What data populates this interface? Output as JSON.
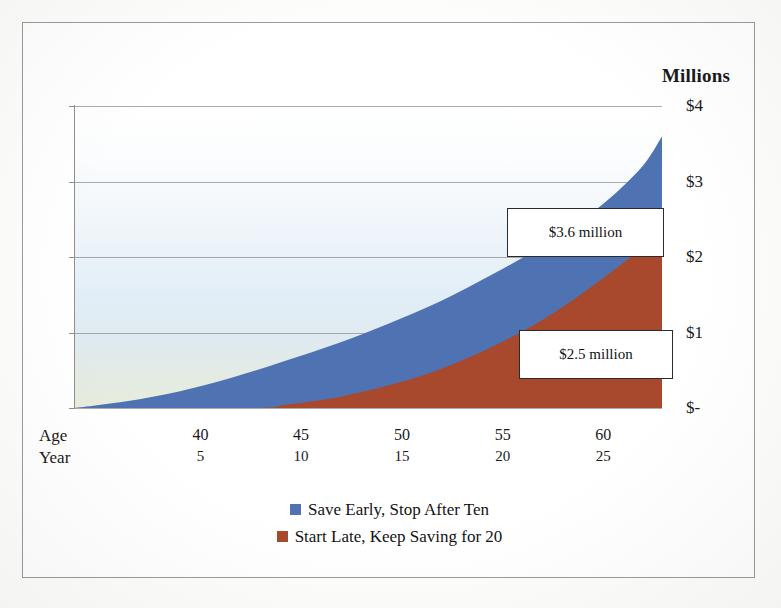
{
  "chart_data": {
    "type": "area",
    "title": "Millions",
    "xlabel": "",
    "ylabel": "Millions",
    "grid": true,
    "legend_position": "bottom-center",
    "stacked": false,
    "ylim": [
      0,
      4
    ],
    "y_ticks": [
      4,
      3,
      2,
      1,
      0
    ],
    "y_tick_labels": [
      "$4",
      "$3",
      "$2",
      "$1",
      "$-"
    ],
    "x_axis_rows": [
      {
        "name": "Age",
        "ticks": [
          "40",
          "45",
          "50",
          "55",
          "60"
        ]
      },
      {
        "name": "Year",
        "ticks": [
          "5",
          "10",
          "15",
          "20",
          "25"
        ]
      }
    ],
    "x_tick_positions_pct": [
      21.5,
      38.6,
      55.8,
      72.9,
      90.0
    ],
    "series": [
      {
        "name": "Save Early, Stop After Ten",
        "color": "#4f72b2",
        "final_value": 3.6,
        "final_label": "$3.6 million",
        "x": [
          0,
          2.5,
          5,
          7.5,
          10,
          12.5,
          15,
          17.5,
          20,
          22.5,
          25,
          27,
          28
        ],
        "values": [
          0.0,
          0.09,
          0.22,
          0.4,
          0.62,
          0.85,
          1.12,
          1.42,
          1.78,
          2.18,
          2.66,
          3.18,
          3.6
        ]
      },
      {
        "name": "Start Late, Keep Saving for 20",
        "color": "#a8482c",
        "final_value": 2.5,
        "final_label": "$2.5 million",
        "x": [
          0,
          8.5,
          10,
          12.5,
          15,
          17.5,
          20,
          22.5,
          25,
          27,
          28
        ],
        "values": [
          0.0,
          0.0,
          0.04,
          0.14,
          0.3,
          0.52,
          0.82,
          1.2,
          1.68,
          2.12,
          2.5
        ]
      }
    ],
    "annotations": [
      {
        "text": "$3.6 million",
        "series": "Save Early, Stop After Ten"
      },
      {
        "text": "$2.5 million",
        "series": "Start Late, Keep Saving for 20"
      }
    ]
  },
  "title": {
    "text": "Millions"
  },
  "y_axis": {
    "labels": [
      {
        "text": "$4"
      },
      {
        "text": "$3"
      },
      {
        "text": "$2"
      },
      {
        "text": "$1"
      },
      {
        "text": "$-"
      }
    ]
  },
  "x_axis": {
    "age_row_title": "Age",
    "year_row_title": "Year",
    "age_ticks": [
      "40",
      "45",
      "50",
      "55",
      "60"
    ],
    "year_ticks": [
      "5",
      "10",
      "15",
      "20",
      "25"
    ]
  },
  "callouts": {
    "blue": "$3.6 million",
    "red": "$2.5 million"
  },
  "legend": {
    "items": [
      {
        "label": "Save Early, Stop After Ten",
        "color": "#4f72b2"
      },
      {
        "label": "Start Late, Keep Saving for 20",
        "color": "#a8482c"
      }
    ]
  },
  "colors": {
    "blue_series": "#4f72b2",
    "red_series": "#a8482c",
    "gridline": "#8f8f8f",
    "frame": "#9a9a96",
    "text": "#1a1a1a"
  }
}
